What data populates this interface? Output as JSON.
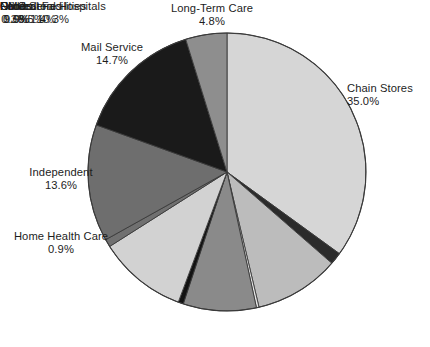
{
  "chart_data": {
    "type": "pie",
    "title": "",
    "subtitle": "",
    "xlabel": "",
    "ylabel": "",
    "legend_position": "none",
    "grid": false,
    "labels_outside": true,
    "value_unit": "%",
    "categories": [
      "Chain Stores",
      "Federal Facilities",
      "Clinics",
      "Other",
      "Food Stores",
      "HMOs",
      "Nonfederal Hospitals",
      "Home Health Care",
      "Independent",
      "Mail Service",
      "Long-Term Care"
    ],
    "values": [
      35.0,
      1.4,
      9.9,
      0.3,
      8.5,
      0.6,
      10.3,
      0.9,
      13.6,
      14.7,
      4.8
    ],
    "colors": [
      "#d6d6d6",
      "#2b2b2b",
      "#bcbcbc",
      "#e6e6e6",
      "#8a8a8a",
      "#121212",
      "#d2d2d2",
      "#707070",
      "#6e6e6e",
      "#1a1a1a",
      "#8e8e8e"
    ],
    "start_angle_deg": 0,
    "direction": "clockwise",
    "slices": [
      {
        "label": "Chain Stores",
        "value": 35.0,
        "value_text": "35.0%",
        "color": "#d6d6d6"
      },
      {
        "label": "Federal Facilities",
        "value": 1.4,
        "value_text": "1.4%",
        "color": "#2b2b2b"
      },
      {
        "label": "Clinics",
        "value": 9.9,
        "value_text": "9.9%",
        "color": "#bcbcbc"
      },
      {
        "label": "Other",
        "value": 0.3,
        "value_text": "0.3%",
        "color": "#e6e6e6"
      },
      {
        "label": "Food Stores",
        "value": 8.5,
        "value_text": "8.5%",
        "color": "#8a8a8a"
      },
      {
        "label": "HMOs",
        "value": 0.6,
        "value_text": "0.6%",
        "color": "#121212"
      },
      {
        "label": "Nonfederal Hospitals",
        "value": 10.3,
        "value_text": "10.3%",
        "color": "#d2d2d2"
      },
      {
        "label": "Home Health Care",
        "value": 0.9,
        "value_text": "0.9%",
        "color": "#707070"
      },
      {
        "label": "Independent",
        "value": 13.6,
        "value_text": "13.6%",
        "color": "#6e6e6e"
      },
      {
        "label": "Mail Service",
        "value": 14.7,
        "value_text": "14.7%",
        "color": "#1a1a1a"
      },
      {
        "label": "Long-Term Care",
        "value": 4.8,
        "value_text": "4.8%",
        "color": "#8e8e8e"
      }
    ]
  },
  "labels": {
    "chain_stores": {
      "name": "Chain Stores",
      "value": "35.0%"
    },
    "federal_facilities": {
      "name": "Federal Facilities",
      "value": "1.4%"
    },
    "clinics": {
      "name": "Clinics",
      "value": "9.9%"
    },
    "other": {
      "name": "Other",
      "value": "0.3%"
    },
    "food_stores": {
      "name": "Food Stores",
      "value": "8.5%"
    },
    "hmos": {
      "name": "HMOs",
      "value": "0.6%"
    },
    "nonfederal_hospitals": {
      "name": "Nonfederal Hospitals",
      "value": "10.3%"
    },
    "home_health_care": {
      "name": "Home Health Care",
      "value": "0.9%"
    },
    "independent": {
      "name": "Independent",
      "value": "13.6%"
    },
    "mail_service": {
      "name": "Mail Service",
      "value": "14.7%"
    },
    "long_term_care": {
      "name": "Long-Term Care",
      "value": "4.8%"
    }
  },
  "geometry": {
    "center_x": 227,
    "center_y": 172,
    "radius": 139,
    "stroke_color": "#3a3a3a"
  }
}
